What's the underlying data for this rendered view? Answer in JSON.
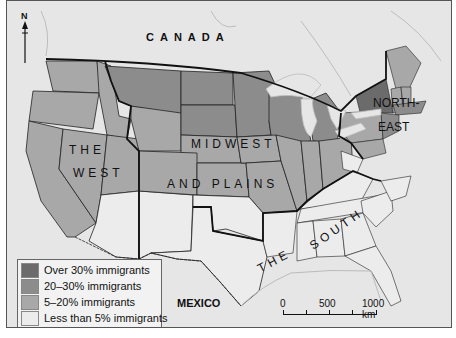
{
  "map": {
    "labels": {
      "canada": "CANADA",
      "mexico": "MEXICO",
      "north": "N",
      "region_west_line1": "THE",
      "region_west_line2": "WEST",
      "region_midwest_line1": "MIDWEST",
      "region_midwest_line2": "AND PLAINS",
      "region_northeast_line1": "NORTH-",
      "region_northeast_line2": "EAST",
      "region_south_line1": "THE",
      "region_south_line2": "SOUTH"
    },
    "colors": {
      "over_30": "#6b6b6b",
      "20_30": "#8c8c8c",
      "5_20": "#a8a8a8",
      "under_5": "#ececec",
      "background": "#e6e6e6",
      "border": "#222222"
    }
  },
  "legend": {
    "items": [
      {
        "label": "Over 30% immigrants",
        "color": "#6b6b6b"
      },
      {
        "label": "20–30% immigrants",
        "color": "#8c8c8c"
      },
      {
        "label": "5–20% immigrants",
        "color": "#a8a8a8"
      },
      {
        "label": "Less than 5% immigrants",
        "color": "#ececec"
      }
    ]
  },
  "scale": {
    "ticks": [
      "0",
      "500",
      "1000 km"
    ]
  }
}
